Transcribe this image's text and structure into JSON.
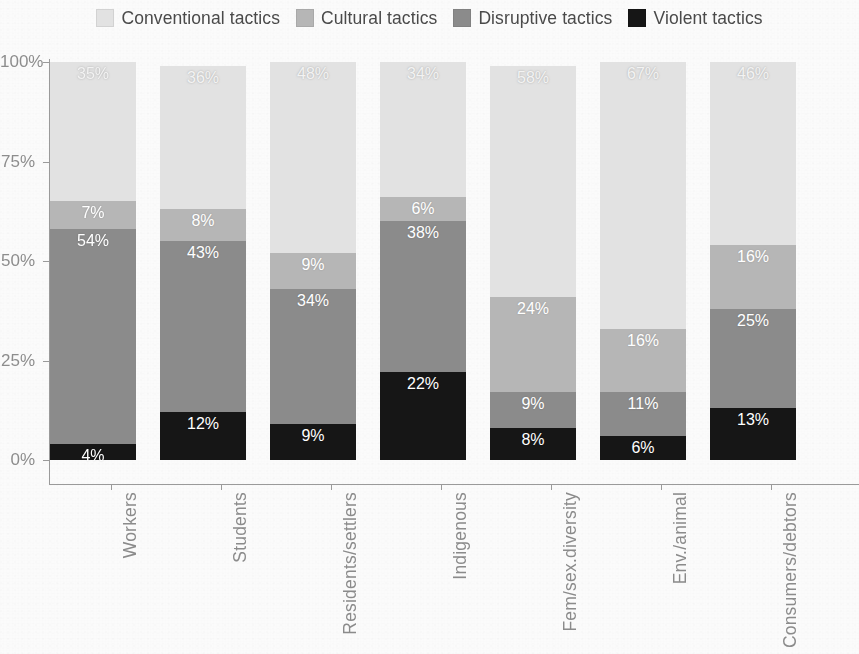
{
  "legend": {
    "position": "top-center",
    "items": [
      {
        "label": "Conventional tactics",
        "color": "#e2e2e2",
        "icon": "legend-swatch"
      },
      {
        "label": "Cultural tactics",
        "color": "#b6b6b6",
        "icon": "legend-swatch"
      },
      {
        "label": "Disruptive tactics",
        "color": "#8b8b8b",
        "icon": "legend-swatch"
      },
      {
        "label": "Violent tactics",
        "color": "#161616",
        "icon": "legend-swatch"
      }
    ]
  },
  "axes": {
    "y_ticks": [
      "0%",
      "25%",
      "50%",
      "75%",
      "100%"
    ],
    "y_tick_values": [
      0,
      25,
      50,
      75,
      100
    ],
    "x_labels": [
      "Workers",
      "Students",
      "Residents/settlers",
      "Indigenous",
      "Fem/sex.diversity",
      "Env./animal",
      "Consumers/debtors"
    ]
  },
  "chart_data": {
    "type": "bar",
    "stacked": true,
    "orientation": "vertical",
    "title": "",
    "subtitle": "",
    "xlabel": "",
    "ylabel": "",
    "ylim": [
      0,
      100
    ],
    "yticks": [
      0,
      25,
      50,
      75,
      100
    ],
    "ytick_labels": [
      "0%",
      "25%",
      "50%",
      "75%",
      "100%"
    ],
    "grid": false,
    "legend_position": "top-center",
    "value_format": "percent",
    "categories": [
      "Workers",
      "Students",
      "Residents/settlers",
      "Indigenous",
      "Fem/sex.diversity",
      "Env./animal",
      "Consumers/debtors"
    ],
    "series": [
      {
        "name": "Violent tactics",
        "color": "#161616",
        "label_color": "#ffffff",
        "values": [
          4,
          12,
          9,
          22,
          8,
          6,
          13
        ],
        "labels": [
          "4%",
          "12%",
          "9%",
          "22%",
          "8%",
          "6%",
          "13%"
        ]
      },
      {
        "name": "Disruptive tactics",
        "color": "#8b8b8b",
        "label_color": "#ffffff",
        "values": [
          54,
          43,
          34,
          38,
          9,
          11,
          25
        ],
        "labels": [
          "54%",
          "43%",
          "34%",
          "38%",
          "9%",
          "11%",
          "25%"
        ]
      },
      {
        "name": "Cultural tactics",
        "color": "#b6b6b6",
        "label_color": "#ffffff",
        "values": [
          7,
          8,
          9,
          6,
          24,
          16,
          16
        ],
        "labels": [
          "7%",
          "8%",
          "9%",
          "6%",
          "24%",
          "16%",
          "16%"
        ]
      },
      {
        "name": "Conventional tactics",
        "color": "#e2e2e2",
        "label_color": "#f3f3f3",
        "values": [
          35,
          36,
          48,
          34,
          58,
          67,
          46
        ],
        "labels": [
          "35%",
          "36%",
          "48%",
          "34%",
          "58%",
          "67%",
          "46%"
        ]
      }
    ]
  }
}
